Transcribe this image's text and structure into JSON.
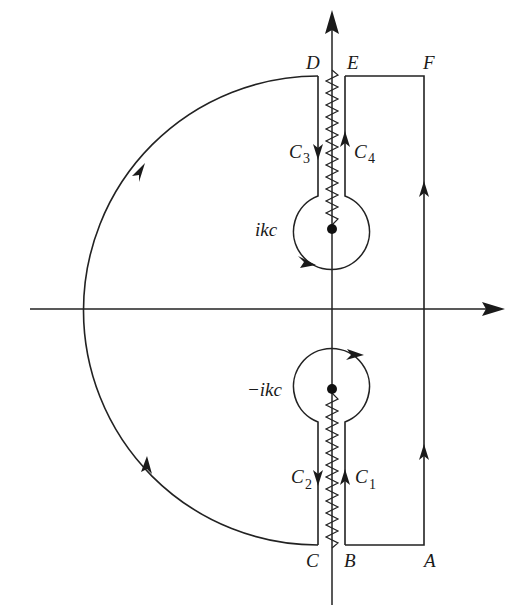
{
  "figure": {
    "colors": {
      "stroke": "#222222",
      "background": "#ffffff"
    },
    "points": {
      "A": "A",
      "B": "B",
      "C": "C",
      "D": "D",
      "E": "E",
      "F": "F"
    },
    "contours": {
      "C1": {
        "letter": "C",
        "sub": "1"
      },
      "C2": {
        "letter": "C",
        "sub": "2"
      },
      "C3": {
        "letter": "C",
        "sub": "3"
      },
      "C4": {
        "letter": "C",
        "sub": "4"
      }
    },
    "branch_points": {
      "upper": "ikc",
      "lower": "−ikc"
    }
  }
}
